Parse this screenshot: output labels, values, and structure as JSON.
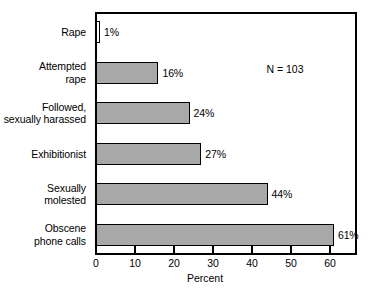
{
  "chart_data": {
    "type": "bar",
    "orientation": "horizontal",
    "title": "",
    "xlabel": "Percent",
    "ylabel": "",
    "xlim": [
      0,
      67
    ],
    "xticks": [
      0,
      10,
      20,
      30,
      40,
      50,
      60
    ],
    "xtick_labels": [
      "0",
      "10",
      "20",
      "30",
      "40",
      "50",
      "60"
    ],
    "grid": false,
    "legend": null,
    "categories": [
      "Rape",
      "Attempted rape",
      "Followed, sexually harassed",
      "Exhibitionist",
      "Sexually molested",
      "Obscene phone calls"
    ],
    "category_lines": [
      [
        "Rape"
      ],
      [
        "Attempted",
        "rape"
      ],
      [
        "Followed,",
        "sexually harassed"
      ],
      [
        "Exhibitionist"
      ],
      [
        "Sexually",
        "molested"
      ],
      [
        "Obscene",
        "phone calls"
      ]
    ],
    "values": [
      1,
      16,
      24,
      27,
      44,
      61
    ],
    "value_labels": [
      "1%",
      "16%",
      "24%",
      "27%",
      "44%",
      "61%"
    ],
    "annotations": [
      {
        "text": "N = 103"
      }
    ],
    "colors": {
      "bar_fill": "#a8a8a8",
      "bar_edge": "#000000",
      "background": "#ffffff",
      "text": "#000000",
      "axis": "#000000"
    }
  }
}
